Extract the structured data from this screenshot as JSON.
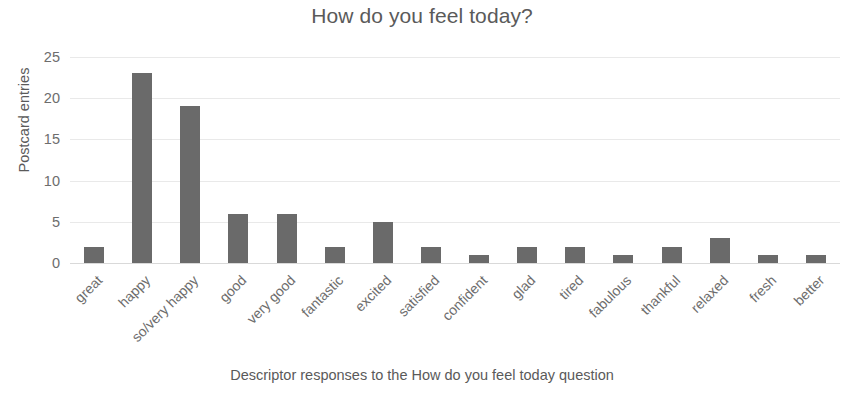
{
  "chart_data": {
    "type": "bar",
    "title": "How do you feel today?",
    "xlabel": "Descriptor responses to the How do you feel today question",
    "ylabel": "Postcard entries",
    "categories": [
      "great",
      "happy",
      "so/very happy",
      "good",
      "very good",
      "fantastic",
      "excited",
      "satisfied",
      "confident",
      "glad",
      "tired",
      "fabulous",
      "thankful",
      "relaxed",
      "fresh",
      "better"
    ],
    "values": [
      2,
      23,
      19,
      6,
      6,
      2,
      5,
      2,
      1,
      2,
      2,
      1,
      2,
      3,
      1,
      1
    ],
    "ylim": [
      0,
      25
    ],
    "yticks": [
      0,
      5,
      10,
      15,
      20,
      25
    ],
    "ytick_labels": [
      "0",
      "5",
      "10",
      "15",
      "20",
      "25"
    ],
    "grid": true,
    "legend": false,
    "legend_position": "none",
    "bar_color": "#6a6a6a",
    "grid_color": "#e9e9e9",
    "text_color": "#5a5a5a",
    "background_color": "#ffffff",
    "xtick_label_rotation": -45
  }
}
